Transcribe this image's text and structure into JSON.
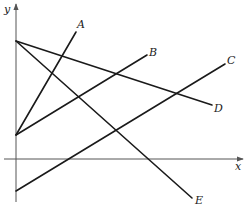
{
  "figure": {
    "type": "coordinate-lines-diagram",
    "axes": {
      "x_label": "x",
      "y_label": "y"
    },
    "lines": [
      {
        "label": "A",
        "from": [
          16,
          135
        ],
        "to": [
          76,
          32
        ],
        "label_pos": [
          79,
          28
        ]
      },
      {
        "label": "B",
        "from": [
          16,
          135
        ],
        "to": [
          147,
          55
        ],
        "label_pos": [
          150,
          56
        ]
      },
      {
        "label": "C",
        "from": [
          16,
          191
        ],
        "to": [
          225,
          64
        ],
        "label_pos": [
          228,
          64
        ]
      },
      {
        "label": "D",
        "from": [
          16,
          41
        ],
        "to": [
          212,
          105
        ],
        "label_pos": [
          215,
          111
        ]
      },
      {
        "label": "E",
        "from": [
          16,
          41
        ],
        "to": [
          192,
          198
        ],
        "label_pos": [
          196,
          203
        ]
      }
    ]
  }
}
